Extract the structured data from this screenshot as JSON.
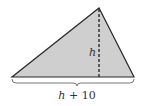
{
  "diagram": {
    "shape": "triangle",
    "fill_color": "#cfcfcf",
    "stroke_color": "#2a2a2a",
    "vertices": {
      "left": [
        12,
        77
      ],
      "right": [
        134,
        77
      ],
      "apex": [
        99,
        8
      ]
    },
    "altitude": {
      "label": "h",
      "style": "dashed",
      "foot": [
        99,
        77
      ]
    },
    "base": {
      "label_var": "h",
      "label_rest": " + 10",
      "brace": true
    }
  }
}
